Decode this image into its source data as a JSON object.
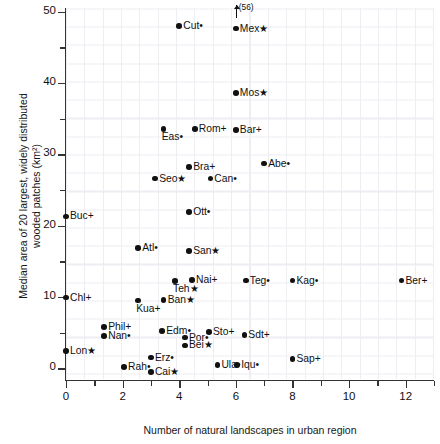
{
  "chart_data": {
    "type": "scatter",
    "title": "",
    "xlabel": "Number of natural landscapes in urban region",
    "ylabel_line1": "Median area of 20 largest, widely distributed",
    "ylabel_line2": "wooded patches (km²)",
    "xlim": [
      0,
      13
    ],
    "ylim": [
      -1.5,
      50.5
    ],
    "xticks": [
      0,
      2,
      4,
      6,
      8,
      10,
      12
    ],
    "xtick_labels": [
      "0",
      "2",
      "4",
      "6",
      "8",
      "10",
      "12"
    ],
    "xticks_minor": [
      1,
      3,
      5,
      7,
      9,
      11,
      13
    ],
    "yticks": [
      0,
      10,
      20,
      30,
      40,
      50
    ],
    "ytick_labels": [
      "0",
      "10",
      "20",
      "30",
      "40",
      "50"
    ],
    "yticks_minor": [
      5,
      15,
      25,
      35,
      45
    ],
    "grid": true,
    "grid_color": "#ededf2",
    "marker_color": "#111111",
    "legend": "none",
    "annotations": [
      {
        "text": "(56)",
        "x": 6,
        "y": 50.5,
        "arrow": "up",
        "refers_to": "Mex"
      }
    ],
    "points": [
      {
        "label": "Cut•",
        "name": "Cut",
        "x": 4.0,
        "y": 48.0,
        "pos": "right"
      },
      {
        "label": "Mex★",
        "name": "Mex",
        "x": 6.0,
        "y": 47.6,
        "pos": "right"
      },
      {
        "label": "Mos★",
        "name": "Mos",
        "x": 6.0,
        "y": 38.6,
        "pos": "right"
      },
      {
        "label": "Rom+",
        "name": "Rom",
        "x": 4.55,
        "y": 33.5,
        "pos": "right"
      },
      {
        "label": "Bar+",
        "name": "Bar",
        "x": 6.0,
        "y": 33.4,
        "pos": "right"
      },
      {
        "label": "Eas•",
        "name": "Eas",
        "x": 3.45,
        "y": 33.5,
        "pos": "below"
      },
      {
        "label": "Abe•",
        "name": "Abe",
        "x": 7.0,
        "y": 28.7,
        "pos": "right"
      },
      {
        "label": "Bra+",
        "name": "Bra",
        "x": 4.35,
        "y": 28.2,
        "pos": "right"
      },
      {
        "label": "Seo★",
        "name": "Seo",
        "x": 3.15,
        "y": 26.6,
        "pos": "right"
      },
      {
        "label": "Can•",
        "name": "Can",
        "x": 5.1,
        "y": 26.6,
        "pos": "right"
      },
      {
        "label": "Ott•",
        "name": "Ott",
        "x": 4.35,
        "y": 21.9,
        "pos": "right"
      },
      {
        "label": "Buc+",
        "name": "Buc",
        "x": 0.0,
        "y": 21.3,
        "pos": "right"
      },
      {
        "label": "Atl•",
        "name": "Atl",
        "x": 2.55,
        "y": 16.9,
        "pos": "right"
      },
      {
        "label": "San★",
        "name": "San",
        "x": 4.35,
        "y": 16.4,
        "pos": "right"
      },
      {
        "label": "Teh★",
        "name": "Teh",
        "x": 3.85,
        "y": 12.2,
        "pos": "below"
      },
      {
        "label": "Nai+",
        "name": "Nai",
        "x": 4.45,
        "y": 12.4,
        "pos": "right"
      },
      {
        "label": "Teg•",
        "name": "Teg",
        "x": 6.35,
        "y": 12.3,
        "pos": "right"
      },
      {
        "label": "Kag•",
        "name": "Kag",
        "x": 8.0,
        "y": 12.3,
        "pos": "right"
      },
      {
        "label": "Ber+",
        "name": "Ber",
        "x": 11.85,
        "y": 12.3,
        "pos": "right"
      },
      {
        "label": "Chl+",
        "name": "Chl",
        "x": 0.0,
        "y": 9.9,
        "pos": "right"
      },
      {
        "label": "Ban★",
        "name": "Ban",
        "x": 3.45,
        "y": 9.6,
        "pos": "right"
      },
      {
        "label": "Kua+",
        "name": "Kua",
        "x": 2.55,
        "y": 9.5,
        "pos": "below"
      },
      {
        "label": "Phil+",
        "name": "Phil",
        "x": 1.35,
        "y": 5.8,
        "pos": "right"
      },
      {
        "label": "Edm•",
        "name": "Edm",
        "x": 3.4,
        "y": 5.2,
        "pos": "right"
      },
      {
        "label": "Sto+",
        "name": "Sto",
        "x": 5.05,
        "y": 5.1,
        "pos": "right"
      },
      {
        "label": "Sdt+",
        "name": "Sdt",
        "x": 6.3,
        "y": 4.7,
        "pos": "right"
      },
      {
        "label": "Nan•",
        "name": "Nan",
        "x": 1.35,
        "y": 4.5,
        "pos": "right"
      },
      {
        "label": "Por•",
        "name": "Por",
        "x": 4.2,
        "y": 4.3,
        "pos": "right"
      },
      {
        "label": "Bei★",
        "name": "Bei",
        "x": 4.2,
        "y": 3.2,
        "pos": "right"
      },
      {
        "label": "Lon★",
        "name": "Lon",
        "x": 0.0,
        "y": 2.4,
        "pos": "right"
      },
      {
        "label": "Erz•",
        "name": "Erz",
        "x": 3.0,
        "y": 1.5,
        "pos": "right"
      },
      {
        "label": "Sap+",
        "name": "Sap",
        "x": 8.0,
        "y": 1.3,
        "pos": "right"
      },
      {
        "label": "Ula•",
        "name": "Ula",
        "x": 5.35,
        "y": 0.5,
        "pos": "right"
      },
      {
        "label": "Iqu•",
        "name": "Iqu",
        "x": 6.05,
        "y": 0.5,
        "pos": "right"
      },
      {
        "label": "Rah•",
        "name": "Rah",
        "x": 2.05,
        "y": 0.2,
        "pos": "right"
      },
      {
        "label": "Cai★",
        "name": "Cai",
        "x": 3.0,
        "y": -0.5,
        "pos": "right"
      }
    ]
  }
}
